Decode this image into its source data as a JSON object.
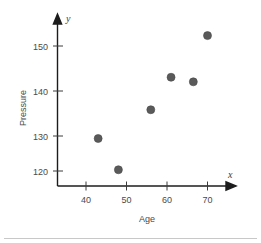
{
  "chart_data": {
    "type": "scatter",
    "title": "",
    "xlabel": "Age",
    "ylabel": "Pressure",
    "x_axis_symbol": "x",
    "y_axis_symbol": "y",
    "xticks": [
      40,
      50,
      60,
      70
    ],
    "yticks": [
      120,
      130,
      140,
      150
    ],
    "xlim": [
      33,
      78
    ],
    "ylim": [
      115,
      157
    ],
    "grid": false,
    "legend": null,
    "marker": {
      "shape": "circle",
      "color": "#5a5a5a",
      "size_px": 5
    },
    "points": [
      {
        "x": 43,
        "y": 127.8
      },
      {
        "x": 48,
        "y": 120.3
      },
      {
        "x": 56,
        "y": 134.7
      },
      {
        "x": 61,
        "y": 142.5
      },
      {
        "x": 66.5,
        "y": 141.4
      },
      {
        "x": 70,
        "y": 152.5
      }
    ]
  },
  "figure": {
    "background": "#ffffff",
    "axis_color": "#1c1c1c",
    "text_color": "#4a4a4a",
    "separator_color": "#c8c8c8"
  }
}
